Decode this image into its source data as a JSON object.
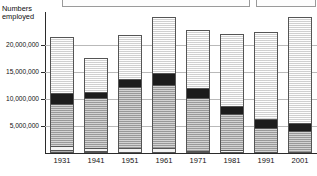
{
  "chart_data": {
    "type": "bar",
    "subtype": "stacked-vertical",
    "title": "",
    "xlabel": "",
    "ylabel": "Numbers employed",
    "ylim": [
      0,
      26000000
    ],
    "grid": true,
    "legend_position": "top",
    "categories": [
      "1931",
      "1941",
      "1951",
      "1961",
      "1971",
      "1981",
      "1991",
      "2001"
    ],
    "ytick_labels": [
      "5,000,000",
      "10,000,000",
      "15,000,000",
      "20,000,000"
    ],
    "ytick_values": [
      5000000,
      10000000,
      15000000,
      20000000
    ],
    "series": [
      {
        "name": "segment-1",
        "fill": "dark-grey-hatched",
        "values": [
          1300000,
          1100000,
          900000,
          900000,
          450000,
          350000,
          300000,
          250000
        ]
      },
      {
        "name": "segment-2",
        "fill": "light-plain",
        "values": [
          600000,
          500000,
          500000,
          500000,
          400000,
          900000,
          250000,
          250000
        ]
      },
      {
        "name": "segment-3",
        "fill": "mid-grey-hatched",
        "values": [
          7500000,
          8900000,
          11100000,
          11400000,
          9500000,
          6300000,
          4500000,
          3900000
        ]
      },
      {
        "name": "segment-4",
        "fill": "black",
        "values": [
          1800000,
          1100000,
          1300000,
          2100000,
          1700000,
          1300000,
          1300000,
          1300000
        ]
      },
      {
        "name": "segment-5",
        "fill": "very-light-hatched",
        "values": [
          10200000,
          6000000,
          7900000,
          10100000,
          10550000,
          13150000,
          15950000,
          19300000
        ]
      }
    ],
    "totals": [
      21400000,
      17600000,
      21700000,
      25000000,
      22600000,
      22000000,
      22300000,
      25000000
    ]
  },
  "axis": {
    "y_title_line1": "Numbers",
    "y_title_line2": "employed"
  },
  "legend": {
    "box_a_label": "",
    "box_b_label": ""
  }
}
